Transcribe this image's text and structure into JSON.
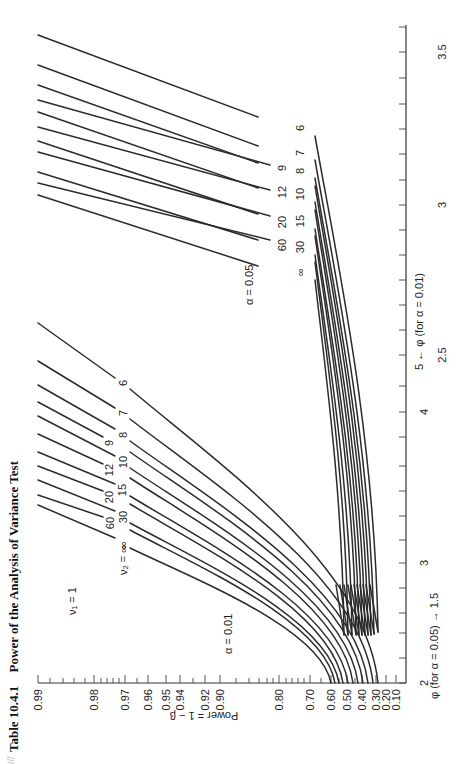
{
  "figure": {
    "table_number": "Table 10.4.1",
    "title": "Power of the Analysis of Variance Test",
    "nu1_label": "ν₁ = 1",
    "nu2_label": "ν₂ = ∞",
    "alpha_001_label": "α = 0.01",
    "alpha_005_label": "α = 0.05",
    "power_axis_label": "Power = 1 − β",
    "phi_axis_label_005": "φ (for α = 0.05) → 1.5",
    "phi_axis_label_001": "5 ← φ (for α = 0.01)",
    "page_mark": "///"
  },
  "chart_data": {
    "type": "line",
    "orientation": "rotated 90° counter-clockwise on page",
    "xlabel": "φ",
    "ylabel": "Power = 1 − β",
    "power_ticks": [
      "0.99",
      "0.98",
      "0.97",
      "0.96",
      "0.95",
      "0.94",
      "0.92",
      "0.90",
      "0.80",
      "0.70",
      "0.60",
      "0.50",
      "0.40",
      "0.30",
      "0.20",
      "0.10"
    ],
    "phi_ticks_alpha_0_05": [
      "2",
      "3",
      "4",
      "5"
    ],
    "phi_ticks_alpha_0_01": [
      "1.5",
      "2.5",
      "3",
      "3.5"
    ],
    "nu2_values": [
      "6",
      "7",
      "8",
      "9",
      "10",
      "12",
      "15",
      "20",
      "30",
      "60",
      "∞"
    ],
    "grid": false,
    "series": [
      {
        "name": "α = 0.05, ν2 = 6",
        "alpha": 0.05,
        "nu2": "6",
        "phi": [
          2.0,
          2.5,
          3.0,
          3.6
        ],
        "power": [
          0.33,
          0.6,
          0.85,
          0.99
        ]
      },
      {
        "name": "α = 0.05, ν2 = 7",
        "alpha": 0.05,
        "nu2": "7",
        "phi": [
          2.0,
          2.5,
          3.0,
          3.5
        ],
        "power": [
          0.34,
          0.63,
          0.88,
          0.99
        ]
      },
      {
        "name": "α = 0.05, ν2 = 8",
        "alpha": 0.05,
        "nu2": "8",
        "phi": [
          2.0,
          2.5,
          3.0,
          3.4
        ],
        "power": [
          0.35,
          0.65,
          0.89,
          0.99
        ]
      },
      {
        "name": "α = 0.05, ν2 = 9",
        "alpha": 0.05,
        "nu2": "9",
        "phi": [
          2.0,
          2.5,
          3.0,
          3.4
        ],
        "power": [
          0.36,
          0.66,
          0.9,
          0.99
        ]
      },
      {
        "name": "α = 0.05, ν2 = 10",
        "alpha": 0.05,
        "nu2": "10",
        "phi": [
          2.0,
          2.5,
          3.0,
          3.3
        ],
        "power": [
          0.37,
          0.68,
          0.91,
          0.99
        ]
      },
      {
        "name": "α = 0.05, ν2 = 12",
        "alpha": 0.05,
        "nu2": "12",
        "phi": [
          2.0,
          2.5,
          3.0,
          3.3
        ],
        "power": [
          0.39,
          0.7,
          0.92,
          0.99
        ]
      },
      {
        "name": "α = 0.05, ν2 = 15",
        "alpha": 0.05,
        "nu2": "15",
        "phi": [
          2.0,
          2.5,
          3.0,
          3.2
        ],
        "power": [
          0.41,
          0.72,
          0.93,
          0.99
        ]
      },
      {
        "name": "α = 0.05, ν2 = 20",
        "alpha": 0.05,
        "nu2": "20",
        "phi": [
          2.0,
          2.5,
          3.0,
          3.2
        ],
        "power": [
          0.43,
          0.74,
          0.94,
          0.99
        ]
      },
      {
        "name": "α = 0.05, ν2 = 30",
        "alpha": 0.05,
        "nu2": "30",
        "phi": [
          2.0,
          2.5,
          3.0,
          3.1
        ],
        "power": [
          0.45,
          0.76,
          0.95,
          0.99
        ]
      },
      {
        "name": "α = 0.05, ν2 = 60",
        "alpha": 0.05,
        "nu2": "60",
        "phi": [
          2.0,
          2.5,
          3.0,
          3.1
        ],
        "power": [
          0.47,
          0.78,
          0.96,
          0.99
        ]
      },
      {
        "name": "α = 0.05, ν2 = ∞",
        "alpha": 0.05,
        "nu2": "∞",
        "phi": [
          2.0,
          2.5,
          3.0,
          3.05
        ],
        "power": [
          0.5,
          0.8,
          0.97,
          0.99
        ]
      },
      {
        "name": "α = 0.01, ν2 = 6",
        "alpha": 0.01,
        "nu2": "6",
        "phi": [
          2.0,
          3.0,
          4.0,
          4.6
        ],
        "power": [
          0.3,
          0.62,
          0.9,
          0.97
        ]
      },
      {
        "name": "α = 0.01, ν2 = 7",
        "alpha": 0.01,
        "nu2": "7",
        "phi": [
          2.0,
          3.0,
          4.0,
          4.4
        ],
        "power": [
          0.32,
          0.66,
          0.93,
          0.97
        ]
      },
      {
        "name": "α = 0.01, ν2 = 8",
        "alpha": 0.01,
        "nu2": "8",
        "phi": [
          2.0,
          3.0,
          4.0,
          4.3
        ],
        "power": [
          0.34,
          0.69,
          0.94,
          0.97
        ]
      },
      {
        "name": "α = 0.01, ν2 = 9",
        "alpha": 0.01,
        "nu2": "9",
        "phi": [
          2.0,
          3.0,
          4.0,
          4.2
        ],
        "power": [
          0.36,
          0.71,
          0.95,
          0.97
        ]
      },
      {
        "name": "α = 0.01, ν2 = 10",
        "alpha": 0.01,
        "nu2": "10",
        "phi": [
          2.0,
          3.0,
          4.0,
          4.1
        ],
        "power": [
          0.38,
          0.73,
          0.95,
          0.97
        ]
      },
      {
        "name": "α = 0.01, ν2 = 12",
        "alpha": 0.01,
        "nu2": "12",
        "phi": [
          2.0,
          3.0,
          3.9,
          4.0
        ],
        "power": [
          0.41,
          0.76,
          0.96,
          0.97
        ]
      },
      {
        "name": "α = 0.01, ν2 = 15",
        "alpha": 0.01,
        "nu2": "15",
        "phi": [
          2.0,
          3.0,
          3.8,
          3.9
        ],
        "power": [
          0.44,
          0.79,
          0.96,
          0.97
        ]
      },
      {
        "name": "α = 0.01, ν2 = 20",
        "alpha": 0.01,
        "nu2": "20",
        "phi": [
          2.0,
          3.0,
          3.7,
          3.8
        ],
        "power": [
          0.47,
          0.82,
          0.96,
          0.97
        ]
      },
      {
        "name": "α = 0.01, ν2 = 30",
        "alpha": 0.01,
        "nu2": "30",
        "phi": [
          2.0,
          3.0,
          3.6,
          3.7
        ],
        "power": [
          0.51,
          0.85,
          0.96,
          0.97
        ]
      },
      {
        "name": "α = 0.01, ν2 = 60",
        "alpha": 0.01,
        "nu2": "60",
        "phi": [
          2.0,
          3.0,
          3.5,
          3.6
        ],
        "power": [
          0.55,
          0.88,
          0.96,
          0.97
        ]
      },
      {
        "name": "α = 0.01, ν2 = ∞",
        "alpha": 0.01,
        "nu2": "∞",
        "phi": [
          2.0,
          3.0,
          3.4,
          3.5
        ],
        "power": [
          0.59,
          0.9,
          0.96,
          0.97
        ]
      }
    ]
  },
  "render": {
    "power_axis": {
      "y": 683,
      "x_start": 38,
      "x_end": 406,
      "ticks": [
        {
          "label": "0.99",
          "x": 38,
          "major": true
        },
        {
          "x": 50
        },
        {
          "x": 63
        },
        {
          "x": 74
        },
        {
          "x": 85
        },
        {
          "label": "0.98",
          "x": 94,
          "major": true
        },
        {
          "x": 101
        },
        {
          "x": 107
        },
        {
          "x": 113
        },
        {
          "x": 119
        },
        {
          "label": "0.97",
          "x": 125,
          "major": true
        },
        {
          "x": 137
        },
        {
          "label": "0.96",
          "x": 148,
          "major": true
        },
        {
          "label": "0.95",
          "x": 166,
          "major": true
        },
        {
          "label": "0.94",
          "x": 180,
          "major": true
        },
        {
          "x": 193
        },
        {
          "label": "0.92",
          "x": 205,
          "major": true
        },
        {
          "label": "0.90",
          "x": 220,
          "major": true
        },
        {
          "x": 236
        },
        {
          "x": 249
        },
        {
          "x": 259
        },
        {
          "x": 267
        },
        {
          "x": 273
        },
        {
          "label": "0.80",
          "x": 279,
          "major": true
        },
        {
          "x": 286
        },
        {
          "x": 292
        },
        {
          "x": 298
        },
        {
          "x": 304
        },
        {
          "label": "0.70",
          "x": 310,
          "major": true
        },
        {
          "x": 321
        },
        {
          "label": "0.60",
          "x": 331,
          "major": true
        },
        {
          "x": 339
        },
        {
          "label": "0.50",
          "x": 347,
          "major": true
        },
        {
          "x": 355
        },
        {
          "label": "0.40",
          "x": 362,
          "major": true
        },
        {
          "label": "0.30",
          "x": 376,
          "major": true
        },
        {
          "label": "0.20",
          "x": 386,
          "major": true
        },
        {
          "label": "0.10",
          "x": 396,
          "major": true
        }
      ]
    },
    "phi_axis": {
      "x": 406,
      "y_start": 683,
      "y_end": 25,
      "ticks": [
        {
          "y": 683,
          "label_005": "2"
        },
        {
          "y": 658
        },
        {
          "y": 633
        },
        {
          "y": 613
        },
        {
          "y": 588
        },
        {
          "y": 563,
          "label_005": "3"
        },
        {
          "y": 540
        },
        {
          "y": 516
        },
        {
          "y": 491
        },
        {
          "y": 466
        },
        {
          "y": 437
        },
        {
          "y": 412,
          "label_005": "4"
        },
        {
          "y": 386
        },
        {
          "y": 355,
          "label_001": "2.5"
        },
        {
          "y": 330
        },
        {
          "y": 305
        },
        {
          "y": 280
        },
        {
          "y": 255
        },
        {
          "y": 230
        },
        {
          "y": 205,
          "label_001": "3"
        },
        {
          "y": 180
        },
        {
          "y": 154
        },
        {
          "y": 129
        },
        {
          "y": 104
        },
        {
          "y": 78
        },
        {
          "y": 52,
          "label_001": "3.5"
        },
        {
          "y": 27
        }
      ]
    },
    "curves_005": [
      {
        "nu2": "6",
        "a": [
          38,
          35
        ],
        "b": [
          258,
          117
        ],
        "c": [
          315,
          136
        ],
        "d": [
          378,
          632
        ],
        "lx": 300,
        "ly": 128
      },
      {
        "nu2": "7",
        "a": [
          38,
          65
        ],
        "b": [
          258,
          146
        ],
        "c": [
          315,
          160
        ],
        "d": [
          374,
          634
        ],
        "lx": 300,
        "ly": 153
      },
      {
        "nu2": "8",
        "a": [
          38,
          85
        ],
        "b": [
          258,
          163
        ],
        "c": [
          315,
          178
        ],
        "d": [
          371,
          635
        ],
        "lx": 300,
        "ly": 171
      },
      {
        "nu2": "9",
        "a": [
          38,
          100
        ],
        "b": [
          270,
          165
        ],
        "c": [
          315,
          186
        ],
        "d": [
          368,
          635
        ],
        "lx": 282,
        "ly": 168
      },
      {
        "nu2": "10",
        "a": [
          38,
          112
        ],
        "b": [
          258,
          188
        ],
        "c": [
          315,
          202
        ],
        "d": [
          365,
          635
        ],
        "lx": 300,
        "ly": 194
      },
      {
        "nu2": "12",
        "a": [
          38,
          127
        ],
        "b": [
          270,
          190
        ],
        "c": [
          315,
          210
        ],
        "d": [
          362,
          635
        ],
        "lx": 282,
        "ly": 192
      },
      {
        "nu2": "15",
        "a": [
          38,
          141
        ],
        "b": [
          258,
          214
        ],
        "c": [
          315,
          229
        ],
        "d": [
          359,
          635
        ],
        "lx": 300,
        "ly": 221
      },
      {
        "nu2": "20",
        "a": [
          38,
          152
        ],
        "b": [
          270,
          216
        ],
        "c": [
          315,
          236
        ],
        "d": [
          356,
          635
        ],
        "lx": 282,
        "ly": 222
      },
      {
        "nu2": "30",
        "a": [
          38,
          172
        ],
        "b": [
          258,
          240
        ],
        "c": [
          315,
          255
        ],
        "d": [
          352,
          635
        ],
        "lx": 300,
        "ly": 247
      },
      {
        "nu2": "60",
        "a": [
          38,
          183
        ],
        "b": [
          270,
          240
        ],
        "c": [
          315,
          262
        ],
        "d": [
          348,
          635
        ],
        "lx": 282,
        "ly": 245
      },
      {
        "nu2": "∞",
        "a": [
          38,
          195
        ],
        "b": [
          258,
          266
        ],
        "c": [
          315,
          280
        ],
        "d": [
          344,
          635
        ],
        "lx": 300,
        "ly": 272
      }
    ],
    "curves_001": [
      {
        "nu2": "6",
        "a": [
          38,
          323
        ],
        "b": [
          115,
          378
        ],
        "c": [
          130,
          389
        ],
        "d": [
          378,
          683
        ],
        "lx": 123,
        "ly": 383
      },
      {
        "nu2": "7",
        "a": [
          38,
          361
        ],
        "b": [
          115,
          408
        ],
        "c": [
          130,
          419
        ],
        "d": [
          373,
          683
        ],
        "lx": 123,
        "ly": 413
      },
      {
        "nu2": "8",
        "a": [
          38,
          385
        ],
        "b": [
          115,
          429
        ],
        "c": [
          130,
          441
        ],
        "d": [
          368,
          683
        ],
        "lx": 123,
        "ly": 435
      },
      {
        "nu2": "9",
        "a": [
          38,
          402
        ],
        "b": [
          103,
          437
        ],
        "c": [
          130,
          452
        ],
        "d": [
          363,
          683
        ],
        "lx": 109,
        "ly": 443
      },
      {
        "nu2": "10",
        "a": [
          38,
          416
        ],
        "b": [
          115,
          456
        ],
        "c": [
          130,
          468
        ],
        "d": [
          358,
          683
        ],
        "lx": 123,
        "ly": 462
      },
      {
        "nu2": "12",
        "a": [
          38,
          434
        ],
        "b": [
          103,
          464
        ],
        "c": [
          130,
          478
        ],
        "d": [
          353,
          683
        ],
        "lx": 109,
        "ly": 470
      },
      {
        "nu2": "15",
        "a": [
          38,
          452
        ],
        "b": [
          115,
          484
        ],
        "c": [
          130,
          496
        ],
        "d": [
          348,
          683
        ],
        "lx": 122,
        "ly": 490
      },
      {
        "nu2": "20",
        "a": [
          38,
          466
        ],
        "b": [
          103,
          491
        ],
        "c": [
          130,
          504
        ],
        "d": [
          343,
          683
        ],
        "lx": 109,
        "ly": 497
      },
      {
        "nu2": "30",
        "a": [
          38,
          480
        ],
        "b": [
          115,
          511
        ],
        "c": [
          130,
          523
        ],
        "d": [
          339,
          683
        ],
        "lx": 123,
        "ly": 517
      },
      {
        "nu2": "60",
        "a": [
          38,
          495
        ],
        "b": [
          103,
          517
        ],
        "c": [
          130,
          530
        ],
        "d": [
          335,
          683
        ],
        "lx": 110,
        "ly": 523
      },
      {
        "nu2": "∞",
        "a": [
          38,
          505
        ],
        "b": [
          115,
          538
        ],
        "c": [
          130,
          548
        ],
        "d": [
          331,
          683
        ],
        "lx": 123,
        "ly": 545
      }
    ]
  }
}
